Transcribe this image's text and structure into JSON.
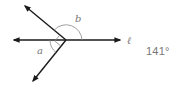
{
  "diagram": {
    "line_label": "ℓ",
    "angle_a_label": "a",
    "angle_b_label": "b",
    "right_angle_marker": true,
    "colors": {
      "stroke": "#1a1a1a",
      "arc": "#888888",
      "label": "#777777"
    }
  },
  "answer": {
    "value": "141°"
  }
}
